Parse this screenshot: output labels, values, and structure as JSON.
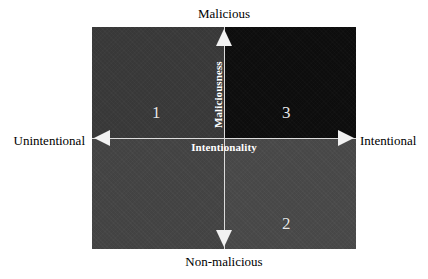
{
  "chart_data": {
    "type": "scatter",
    "title": "",
    "subtitle": "",
    "xlabel": "Intentionality",
    "ylabel": "Maliciousness",
    "xlim": [
      "Unintentional",
      "Intentional"
    ],
    "ylim": [
      "Non-malicious",
      "Malicious"
    ],
    "grid": false,
    "legend": "none",
    "axis_labels": {
      "top": "Malicious",
      "bottom": "Non-malicious",
      "left": "Unintentional",
      "right": "Intentional",
      "vertical_axis": "Maliciousness",
      "horizontal_axis": "Intentionality"
    },
    "quadrants": [
      {
        "id": "top-left",
        "label": "1",
        "x_region": "Unintentional",
        "y_region": "Malicious",
        "fill": "#3a3a3a"
      },
      {
        "id": "top-right",
        "label": "3",
        "x_region": "Intentional",
        "y_region": "Malicious",
        "fill": "#0d0d0d"
      },
      {
        "id": "bottom-left",
        "label": "",
        "x_region": "Unintentional",
        "y_region": "Non-malicious",
        "fill": "#454545"
      },
      {
        "id": "bottom-right",
        "label": "2",
        "x_region": "Intentional",
        "y_region": "Non-malicious",
        "fill": "#4a4a4a"
      }
    ],
    "categories": [
      "1",
      "2",
      "3"
    ],
    "values": [
      1,
      2,
      3
    ]
  },
  "colors": {
    "background": "#ffffff",
    "axis_line": "#dcdcdc",
    "arrow_fill": "#f2f2f2",
    "inner_text": "#ffffff",
    "outer_text": "#000000",
    "quadrant_number": "#e8e8e8"
  },
  "icons": {
    "arrow_up": "triangle-up-icon",
    "arrow_down": "triangle-down-icon",
    "arrow_left": "triangle-left-icon",
    "arrow_right": "triangle-right-icon"
  }
}
